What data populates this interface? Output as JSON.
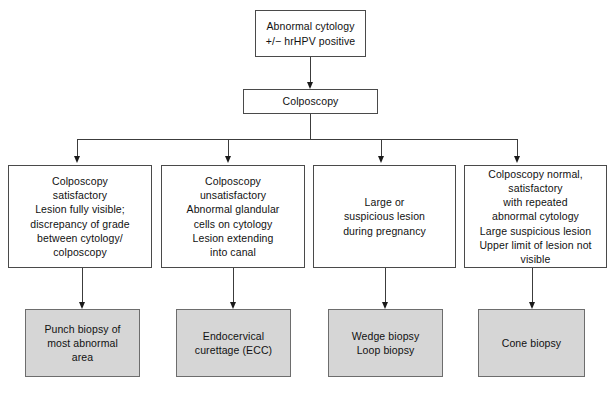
{
  "diagram": {
    "colors": {
      "box_fill": "#ffffff",
      "shaded_box_fill": "#d6d6d6",
      "border": "#4a4a4a",
      "shaded_border": "#6d6d6d",
      "connector": "#3c3c3c",
      "text": "#111111",
      "background": "#ffffff"
    },
    "nodes": {
      "start": {
        "id": "abnormal-cytology",
        "text": "Abnormal cytology\n+/− hrHPV positive",
        "style": "plain"
      },
      "colposcopy": {
        "id": "colposcopy",
        "text": "Colposcopy",
        "style": "plain"
      },
      "findings": [
        {
          "id": "colposcopy-satisfactory",
          "text": "Colposcopy\nsatisfactory\nLesion fully visible;\ndiscrepancy of grade\nbetween cytology/\ncolposcopy",
          "style": "plain"
        },
        {
          "id": "colposcopy-unsatisfactory",
          "text": "Colposcopy\nunsatisfactory\nAbnormal glandular\ncells on cytology\nLesion extending\ninto canal",
          "style": "plain"
        },
        {
          "id": "large-suspicious-pregnancy",
          "text": "Large or\nsuspicious lesion\nduring pregnancy",
          "style": "plain"
        },
        {
          "id": "colposcopy-normal-repeated",
          "text": "Colposcopy normal,\nsatisfactory\nwith repeated\nabnormal cytology\nLarge suspicious lesion\nUpper limit of lesion not visible",
          "style": "plain"
        }
      ],
      "procedures": [
        {
          "id": "punch-biopsy",
          "text": "Punch biopsy of\nmost abnormal\narea",
          "style": "shaded"
        },
        {
          "id": "endocervical-curettage",
          "text": "Endocervical\ncurettage (ECC)",
          "style": "shaded"
        },
        {
          "id": "wedge-loop-biopsy",
          "text": "Wedge biopsy\nLoop biopsy",
          "style": "shaded"
        },
        {
          "id": "cone-biopsy",
          "text": "Cone biopsy",
          "style": "shaded"
        }
      ]
    }
  }
}
